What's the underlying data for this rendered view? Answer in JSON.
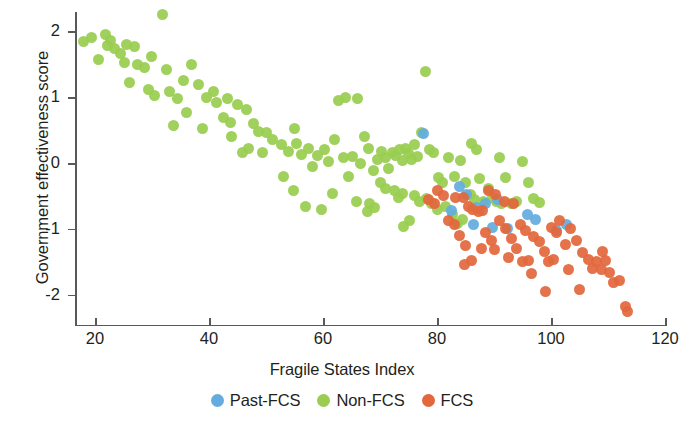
{
  "chart_data": {
    "type": "scatter",
    "title": "",
    "xlabel": "Fragile States Index",
    "ylabel": "Government effectiveness score",
    "xlim": [
      17,
      121
    ],
    "ylim": [
      -2.45,
      2.45
    ],
    "xticks": [
      20,
      40,
      60,
      80,
      100,
      120
    ],
    "yticks": [
      -2,
      -1,
      0,
      1,
      2
    ],
    "xticklabels": [
      "20",
      "40",
      "60",
      "80",
      "100",
      "120"
    ],
    "yticklabels": [
      "-2",
      "-1",
      "0",
      "1",
      "2"
    ],
    "grid": false,
    "legend_position": "bottom-center",
    "colors": {
      "past_fcs": "#64ace0",
      "non_fcs": "#9acd51",
      "fcs": "#e2673c",
      "axis": "#58595b",
      "text": "#231f20",
      "background": "#ffffff"
    },
    "series": [
      {
        "name": "Past-FCS",
        "color": "#64ace0",
        "points": [
          [
            77.6,
            0.45
          ],
          [
            82.5,
            -0.72
          ],
          [
            85.2,
            -0.48
          ],
          [
            87.0,
            -0.68
          ],
          [
            88.5,
            -0.62
          ],
          [
            86.4,
            -0.93
          ],
          [
            89.8,
            -0.98
          ],
          [
            92.3,
            -1.0
          ],
          [
            95.8,
            -0.78
          ],
          [
            97.2,
            -0.86
          ],
          [
            101.0,
            -1.02
          ],
          [
            102.8,
            -0.94
          ],
          [
            90.6,
            -0.55
          ],
          [
            84.0,
            -0.35
          ]
        ]
      },
      {
        "name": "Non-FCS",
        "color": "#9acd51",
        "points": [
          [
            18.0,
            1.84
          ],
          [
            19.4,
            1.9
          ],
          [
            20.6,
            1.57
          ],
          [
            21.8,
            1.95
          ],
          [
            22.2,
            1.79
          ],
          [
            22.8,
            1.86
          ],
          [
            23.5,
            1.74
          ],
          [
            24.4,
            1.66
          ],
          [
            25.2,
            1.53
          ],
          [
            26.0,
            1.22
          ],
          [
            27.4,
            1.5
          ],
          [
            28.6,
            1.45
          ],
          [
            29.3,
            1.11
          ],
          [
            31.8,
            2.26
          ],
          [
            32.6,
            1.42
          ],
          [
            33.0,
            1.08
          ],
          [
            30.4,
            1.02
          ],
          [
            34.5,
            0.98
          ],
          [
            35.6,
            1.25
          ],
          [
            36.9,
            1.49
          ],
          [
            33.8,
            0.57
          ],
          [
            38.2,
            1.2
          ],
          [
            39.5,
            1.0
          ],
          [
            40.8,
            1.08
          ],
          [
            41.4,
            0.92
          ],
          [
            42.6,
            0.69
          ],
          [
            43.8,
            0.62
          ],
          [
            43.2,
            0.98
          ],
          [
            45.0,
            0.89
          ],
          [
            46.5,
            0.82
          ],
          [
            47.8,
            0.6
          ],
          [
            44.0,
            0.4
          ],
          [
            48.7,
            0.48
          ],
          [
            50.0,
            0.46
          ],
          [
            51.2,
            0.35
          ],
          [
            49.3,
            0.16
          ],
          [
            52.8,
            0.28
          ],
          [
            53.9,
            0.18
          ],
          [
            54.8,
            -0.42
          ],
          [
            55.4,
            0.3
          ],
          [
            56.3,
            0.13
          ],
          [
            57.5,
            0.22
          ],
          [
            58.2,
            -0.05
          ],
          [
            59.0,
            0.12
          ],
          [
            60.3,
            0.2
          ],
          [
            61.0,
            0.02
          ],
          [
            62.1,
            0.35
          ],
          [
            57.0,
            -0.66
          ],
          [
            62.8,
            0.95
          ],
          [
            63.6,
            0.08
          ],
          [
            64.4,
            -0.2
          ],
          [
            65.2,
            0.1
          ],
          [
            65.8,
            -0.58
          ],
          [
            66.5,
            0.0
          ],
          [
            67.2,
            0.4
          ],
          [
            68.0,
            0.22
          ],
          [
            68.8,
            -0.12
          ],
          [
            69.5,
            0.06
          ],
          [
            64.0,
            1.0
          ],
          [
            66.0,
            0.98
          ],
          [
            70.2,
            0.18
          ],
          [
            70.9,
            0.08
          ],
          [
            71.5,
            -0.08
          ],
          [
            72.2,
            0.16
          ],
          [
            72.8,
            0.12
          ],
          [
            73.4,
            0.2
          ],
          [
            73.9,
            0.04
          ],
          [
            74.5,
            0.22
          ],
          [
            75.0,
            0.14
          ],
          [
            75.5,
            0.06
          ],
          [
            76.1,
            0.28
          ],
          [
            76.6,
            0.1
          ],
          [
            70.0,
            -0.3
          ],
          [
            71.0,
            -0.38
          ],
          [
            72.5,
            -0.42
          ],
          [
            73.2,
            -0.52
          ],
          [
            74.0,
            -0.46
          ],
          [
            68.2,
            -0.62
          ],
          [
            69.0,
            -0.68
          ],
          [
            77.2,
            0.46
          ],
          [
            78.0,
            1.39
          ],
          [
            78.6,
            0.2
          ],
          [
            79.4,
            0.16
          ],
          [
            80.2,
            -0.22
          ],
          [
            81.0,
            -0.3
          ],
          [
            82.0,
            0.08
          ],
          [
            83.0,
            -0.2
          ],
          [
            84.2,
            0.04
          ],
          [
            85.0,
            -0.3
          ],
          [
            85.8,
            -0.48
          ],
          [
            86.6,
            -0.56
          ],
          [
            87.4,
            -0.24
          ],
          [
            88.2,
            -0.58
          ],
          [
            89.0,
            -0.38
          ],
          [
            89.8,
            -0.52
          ],
          [
            86.0,
            0.3
          ],
          [
            87.0,
            0.2
          ],
          [
            90.5,
            -0.58
          ],
          [
            91.3,
            -0.62
          ],
          [
            92.0,
            -0.22
          ],
          [
            93.0,
            -0.62
          ],
          [
            94.0,
            -0.58
          ],
          [
            95.0,
            0.02
          ],
          [
            96.0,
            -0.3
          ],
          [
            97.0,
            -0.54
          ],
          [
            98.0,
            -0.6
          ],
          [
            91.0,
            0.08
          ],
          [
            79.0,
            -0.62
          ],
          [
            80.0,
            -0.7
          ],
          [
            81.5,
            -0.66
          ],
          [
            82.8,
            -0.78
          ],
          [
            83.6,
            -0.92
          ],
          [
            84.5,
            -0.86
          ],
          [
            76.0,
            -0.5
          ],
          [
            77.0,
            -0.58
          ],
          [
            78.2,
            -0.54
          ],
          [
            75.2,
            -0.88
          ],
          [
            74.2,
            -0.96
          ],
          [
            59.8,
            -0.7
          ],
          [
            55.0,
            0.52
          ],
          [
            47.0,
            0.22
          ],
          [
            38.8,
            0.52
          ],
          [
            36.0,
            0.76
          ],
          [
            29.9,
            1.62
          ],
          [
            27.0,
            1.77
          ],
          [
            25.5,
            1.8
          ],
          [
            45.8,
            0.16
          ],
          [
            53.0,
            -0.2
          ],
          [
            61.6,
            -0.46
          ],
          [
            67.8,
            -0.74
          ]
        ]
      },
      {
        "name": "FCS",
        "color": "#e2673c",
        "points": [
          [
            80.0,
            -0.42
          ],
          [
            81.2,
            -0.5
          ],
          [
            83.2,
            -0.52
          ],
          [
            84.6,
            -0.52
          ],
          [
            85.5,
            -0.66
          ],
          [
            86.2,
            -0.7
          ],
          [
            87.2,
            -0.74
          ],
          [
            88.0,
            -0.72
          ],
          [
            89.0,
            -0.42
          ],
          [
            90.2,
            -0.48
          ],
          [
            82.0,
            -0.88
          ],
          [
            83.0,
            -0.94
          ],
          [
            84.0,
            -1.1
          ],
          [
            85.0,
            -1.25
          ],
          [
            86.0,
            -1.48
          ],
          [
            84.8,
            -1.54
          ],
          [
            88.5,
            -1.06
          ],
          [
            89.5,
            -1.18
          ],
          [
            91.0,
            -0.88
          ],
          [
            92.0,
            -1.0
          ],
          [
            93.0,
            -1.14
          ],
          [
            94.0,
            -1.3
          ],
          [
            95.0,
            -1.5
          ],
          [
            96.0,
            -1.48
          ],
          [
            97.0,
            -1.12
          ],
          [
            98.0,
            -1.2
          ],
          [
            98.8,
            -1.34
          ],
          [
            99.6,
            -1.5
          ],
          [
            100.4,
            -1.46
          ],
          [
            96.5,
            -1.68
          ],
          [
            99.0,
            -1.96
          ],
          [
            101.5,
            -0.88
          ],
          [
            102.5,
            -1.24
          ],
          [
            103.5,
            -1.0
          ],
          [
            104.5,
            -1.18
          ],
          [
            105.5,
            -1.36
          ],
          [
            106.5,
            -1.46
          ],
          [
            107.3,
            -1.6
          ],
          [
            108.0,
            -1.5
          ],
          [
            108.8,
            -1.62
          ],
          [
            109.5,
            -1.48
          ],
          [
            110.2,
            -1.66
          ],
          [
            111.0,
            -1.82
          ],
          [
            112.0,
            -1.78
          ],
          [
            113.0,
            -2.18
          ],
          [
            113.5,
            -2.26
          ],
          [
            105.0,
            -1.92
          ],
          [
            78.5,
            -0.56
          ],
          [
            79.5,
            -0.62
          ],
          [
            91.8,
            -0.58
          ],
          [
            93.5,
            -0.62
          ],
          [
            100.0,
            -0.98
          ],
          [
            101.0,
            -1.06
          ],
          [
            87.8,
            -1.3
          ],
          [
            90.0,
            -1.32
          ],
          [
            92.5,
            -1.44
          ],
          [
            103.0,
            -1.62
          ],
          [
            109.0,
            -1.34
          ],
          [
            94.6,
            -0.94
          ],
          [
            95.5,
            -1.02
          ]
        ]
      }
    ]
  },
  "axis": {
    "x_title": "Fragile States Index",
    "y_title": "Government effectiveness score"
  },
  "legend": {
    "items": [
      {
        "label": "Past-FCS",
        "color": "#64ace0"
      },
      {
        "label": "Non-FCS",
        "color": "#9acd51"
      },
      {
        "label": "FCS",
        "color": "#e2673c"
      }
    ]
  }
}
